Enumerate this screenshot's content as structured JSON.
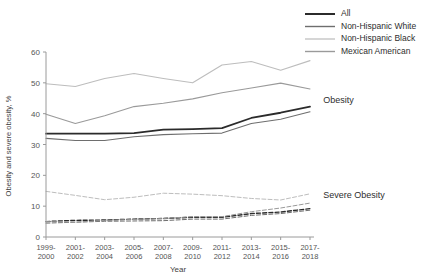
{
  "chart_data": {
    "type": "line",
    "title": "",
    "xlabel": "Year",
    "ylabel": "Obesity and severe obesity, %",
    "ylim": [
      0,
      60
    ],
    "yticks": [
      0,
      10,
      20,
      30,
      40,
      50,
      60
    ],
    "grid": false,
    "legend_position": "top-right",
    "categories": [
      "1999-\n2000",
      "2001-\n2002",
      "2003-\n2004",
      "2005-\n2006",
      "2007-\n2008",
      "2009-\n2010",
      "2011-\n2012",
      "2013-\n2014",
      "2015-\n2016",
      "2017-\n2018"
    ],
    "category_labels_line1": [
      "1999-",
      "2001-",
      "2003-",
      "2005-",
      "2007-",
      "2009-",
      "2011-",
      "2013-",
      "2015-",
      "2017-"
    ],
    "category_labels_line2": [
      "2000",
      "2002",
      "2004",
      "2006",
      "2008",
      "2010",
      "2012",
      "2014",
      "2016",
      "2018"
    ],
    "groups": [
      {
        "name": "Obesity",
        "style": "solid",
        "annotation": "Obesity"
      },
      {
        "name": "Severe Obesity",
        "style": "dashed",
        "annotation": "Severe Obesity"
      }
    ],
    "annotations": [
      {
        "text": "Obesity",
        "x": 9.45,
        "y": 44.5
      },
      {
        "text": "Severe Obesity",
        "x": 9.45,
        "y": 13.5
      }
    ],
    "series": [
      {
        "name": "All",
        "group": "Obesity",
        "style": "solid",
        "color": "#2b2b2b",
        "width": 1.8,
        "values": [
          33.5,
          33.5,
          33.5,
          33.7,
          34.8,
          35.0,
          35.3,
          38.6,
          40.3,
          42.3
        ]
      },
      {
        "name": "Non-Hispanic White",
        "group": "Obesity",
        "style": "solid",
        "color": "#6e6e6e",
        "width": 1.1,
        "values": [
          32.0,
          31.3,
          31.3,
          32.5,
          33.2,
          33.5,
          33.7,
          36.8,
          38.2,
          40.6
        ]
      },
      {
        "name": "Non-Hispanic Black",
        "group": "Obesity",
        "style": "solid",
        "color": "#bdbdbd",
        "width": 1.1,
        "values": [
          49.7,
          48.8,
          51.4,
          53.0,
          51.4,
          50.0,
          55.8,
          56.9,
          54.1,
          57.2
        ]
      },
      {
        "name": "Mexican American",
        "group": "Obesity",
        "style": "solid",
        "color": "#9a9a9a",
        "width": 1.1,
        "values": [
          39.8,
          36.8,
          39.3,
          42.3,
          43.4,
          44.8,
          46.8,
          48.3,
          49.9,
          48.0
        ]
      },
      {
        "name": "All",
        "group": "Severe Obesity",
        "style": "dashed",
        "color": "#2b2b2b",
        "width": 1.4,
        "values": [
          5.0,
          5.4,
          5.5,
          5.8,
          6.0,
          6.4,
          6.4,
          7.6,
          8.1,
          9.2
        ]
      },
      {
        "name": "Non-Hispanic White",
        "group": "Severe Obesity",
        "style": "dashed",
        "color": "#6e6e6e",
        "width": 1.0,
        "values": [
          4.5,
          4.8,
          5.1,
          5.2,
          5.3,
          5.8,
          5.8,
          7.0,
          7.6,
          8.7
        ]
      },
      {
        "name": "Non-Hispanic Black",
        "group": "Severe Obesity",
        "style": "dashed",
        "color": "#bdbdbd",
        "width": 1.0,
        "values": [
          14.8,
          13.5,
          12.1,
          12.9,
          14.2,
          13.9,
          13.4,
          12.5,
          12.0,
          14.0
        ]
      },
      {
        "name": "Mexican American",
        "group": "Severe Obesity",
        "style": "dashed",
        "color": "#9a9a9a",
        "width": 1.0,
        "values": [
          5.0,
          4.8,
          5.4,
          5.7,
          6.0,
          6.6,
          6.6,
          8.2,
          9.4,
          11.0
        ]
      }
    ]
  },
  "legend": {
    "items": [
      {
        "label": "All",
        "color": "#2b2b2b",
        "width": 2.0
      },
      {
        "label": "Non-Hispanic White",
        "color": "#6e6e6e",
        "width": 1.4
      },
      {
        "label": "Non-Hispanic Black",
        "color": "#c4c4c4",
        "width": 1.4
      },
      {
        "label": "Mexican American",
        "color": "#9a9a9a",
        "width": 1.4
      }
    ]
  },
  "axes": {
    "y_title": "Obesity and severe obesity, %",
    "x_title": "Year",
    "ytick_labels": [
      "0",
      "10",
      "20",
      "30",
      "40",
      "50",
      "60"
    ]
  }
}
